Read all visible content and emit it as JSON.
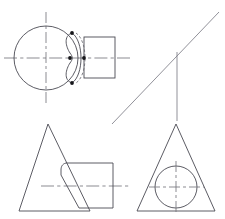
{
  "document": {
    "kind": "engineering-drawing",
    "title": "Orthographic Projection Views",
    "sheet_width": 225,
    "sheet_height": 219,
    "background_color": "#ffffff",
    "line_colors": {
      "visible_outline": "#4a4a52",
      "hidden_line": "#6a6a72",
      "center_line": "#76767e",
      "construction_line": "#7d7d86",
      "vertex_dot": "#16161a"
    }
  },
  "views": {
    "top_left": {
      "name": "circle-with-notch-and-flange",
      "circle": {
        "cx": 46,
        "cy": 58,
        "r": 32
      },
      "vertical_center_line": {
        "x": 46,
        "y1": 12,
        "y2": 104
      },
      "horizontal_center_line": {
        "y": 58,
        "x1": 4,
        "x2": 133
      },
      "flange_rect": {
        "x": 84,
        "y": 37,
        "width": 31,
        "height": 41
      },
      "notch_profile_path": "M 72 33 C 63 36 66 47 70 53 C 73 57 73 59 70 63 C 66 69 63 80 72 83",
      "hidden_arc_path": "M 76 33 C 88 41 88 75 76 83",
      "visible_arc_path": "M 72 33 C 84 41 84 75 72 83",
      "vertex_dots": [
        {
          "cx": 72,
          "cy": 33,
          "r": 1.9
        },
        {
          "cx": 70,
          "cy": 58,
          "r": 1.9
        },
        {
          "cx": 84,
          "cy": 58,
          "r": 1.9
        },
        {
          "cx": 72,
          "cy": 83,
          "r": 1.9
        }
      ]
    },
    "top_right": {
      "name": "crosshair-with-diagonal-construction-line",
      "diagonal_line": {
        "x1": 112,
        "y1": 124,
        "x2": 219,
        "y2": 12
      },
      "vertical_line": {
        "x": 177,
        "y1": 52,
        "y2": 121
      },
      "horizontal_center_line": {
        "y": 58,
        "x1": 128,
        "x2": 186
      },
      "intersection_point": {
        "x": 177,
        "y": 58
      }
    },
    "bottom_left": {
      "name": "triangle-overlapping-curved-block",
      "triangle": {
        "apex_x": 48,
        "apex_y": 124,
        "left_x": 19,
        "right_x": 90,
        "base_y": 211
      },
      "block_path": "M 66 163 C 62 164 61 167 61 170 L 61 175 L 79 208 L 113 208 L 113 163 Z",
      "block_rect": {
        "x": 61,
        "y": 163,
        "width": 52,
        "height": 45
      },
      "horizontal_center_line": {
        "y": 186,
        "x1": 41,
        "x2": 131
      }
    },
    "bottom_right": {
      "name": "triangle-with-inscribed-circle",
      "triangle": {
        "apex_x": 176,
        "apex_y": 124,
        "left_x": 137,
        "right_x": 215,
        "base_y": 211
      },
      "circle": {
        "cx": 176,
        "cy": 187,
        "r": 21
      },
      "vertical_center_line": {
        "x": 176,
        "y1": 161,
        "y2": 213
      },
      "horizontal_center_line": {
        "y": 187,
        "x1": 149,
        "x2": 204
      }
    }
  }
}
